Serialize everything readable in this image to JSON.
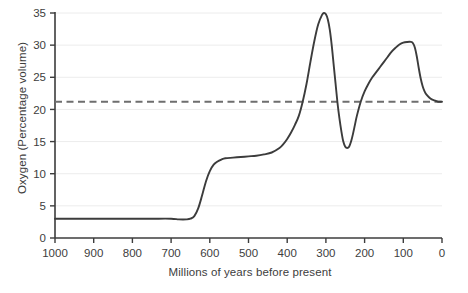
{
  "chart_data": {
    "type": "line",
    "title": "",
    "xlabel": "Millions of years before present",
    "ylabel": "Oxygen (Percentage volume)",
    "xlim": [
      1000,
      0
    ],
    "ylim": [
      0,
      35
    ],
    "x_reversed": true,
    "grid": "horizontal-light",
    "legend": "none",
    "xticks": [
      "1000",
      "900",
      "800",
      "700",
      "600",
      "500",
      "400",
      "300",
      "200",
      "100",
      "0"
    ],
    "xtick_values": [
      1000,
      900,
      800,
      700,
      600,
      500,
      400,
      300,
      200,
      100,
      0
    ],
    "yticks": [
      "0",
      "5",
      "10",
      "15",
      "20",
      "25",
      "30",
      "35"
    ],
    "ytick_values": [
      0,
      5,
      10,
      15,
      20,
      25,
      30,
      35
    ],
    "series": [
      {
        "name": "Atmospheric oxygen",
        "style": "solid",
        "color": "#3c3c3c",
        "x": [
          1000,
          950,
          900,
          850,
          800,
          750,
          700,
          680,
          660,
          650,
          640,
          630,
          620,
          610,
          600,
          590,
          580,
          570,
          560,
          540,
          520,
          500,
          480,
          460,
          440,
          420,
          410,
          400,
          390,
          380,
          370,
          360,
          350,
          340,
          330,
          320,
          310,
          305,
          300,
          295,
          290,
          285,
          280,
          275,
          270,
          265,
          260,
          255,
          250,
          245,
          240,
          235,
          230,
          225,
          220,
          210,
          200,
          190,
          180,
          170,
          160,
          150,
          140,
          130,
          120,
          110,
          100,
          90,
          80,
          75,
          70,
          65,
          60,
          55,
          50,
          45,
          40,
          30,
          20,
          10,
          0
        ],
        "y": [
          3.0,
          3.0,
          3.0,
          3.0,
          3.0,
          3.0,
          3.0,
          2.9,
          2.9,
          3.0,
          3.4,
          4.6,
          6.6,
          8.8,
          10.4,
          11.4,
          11.9,
          12.2,
          12.4,
          12.5,
          12.6,
          12.7,
          12.8,
          13.0,
          13.3,
          14.0,
          14.6,
          15.4,
          16.4,
          17.6,
          19.0,
          21.2,
          24.0,
          27.4,
          30.6,
          33.2,
          34.7,
          35.0,
          34.8,
          34.0,
          32.4,
          30.0,
          27.0,
          24.0,
          21.0,
          18.6,
          16.6,
          15.0,
          14.2,
          14.0,
          14.2,
          15.0,
          16.2,
          17.6,
          19.0,
          21.2,
          22.8,
          24.0,
          25.0,
          25.8,
          26.6,
          27.4,
          28.2,
          29.0,
          29.6,
          30.1,
          30.4,
          30.5,
          30.5,
          30.3,
          29.6,
          28.2,
          26.4,
          24.8,
          23.6,
          22.8,
          22.3,
          21.7,
          21.4,
          21.2,
          21.2
        ]
      },
      {
        "name": "Present-day oxygen level",
        "style": "dashed",
        "color": "#6e6e6e",
        "constant_y": 21.2
      }
    ]
  }
}
